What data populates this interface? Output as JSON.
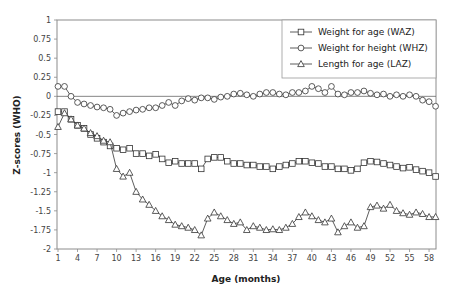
{
  "chart_data": {
    "type": "line",
    "title": "",
    "xlabel": "Age (months)",
    "ylabel": "Z-scores (WHO)",
    "xlim": [
      1,
      59
    ],
    "ylim": [
      -2,
      1
    ],
    "grid": false,
    "legend_position": "top-right",
    "x_ticks": [
      "1",
      "4",
      "7",
      "10",
      "13",
      "16",
      "19",
      "22",
      "25",
      "28",
      "31",
      "34",
      "37",
      "40",
      "43",
      "46",
      "49",
      "52",
      "55",
      "58"
    ],
    "y_ticks": [
      "1",
      "0.75",
      "0.5",
      "0.25",
      "0",
      "-0.25",
      "-0.5",
      "-0.75",
      "-1",
      "-1.25",
      "-1.5",
      "-1.75",
      "-2"
    ],
    "x": [
      1,
      2,
      3,
      4,
      5,
      6,
      7,
      8,
      9,
      10,
      11,
      12,
      13,
      14,
      15,
      16,
      17,
      18,
      19,
      20,
      21,
      22,
      23,
      24,
      25,
      26,
      27,
      28,
      29,
      30,
      31,
      32,
      33,
      34,
      35,
      36,
      37,
      38,
      39,
      40,
      41,
      42,
      43,
      44,
      45,
      46,
      47,
      48,
      49,
      50,
      51,
      52,
      53,
      54,
      55,
      56,
      57,
      58,
      59
    ],
    "series": [
      {
        "name": "Weight for age (WAZ)",
        "marker": "square",
        "values": [
          -0.2,
          -0.2,
          -0.3,
          -0.38,
          -0.42,
          -0.5,
          -0.55,
          -0.6,
          -0.65,
          -0.68,
          -0.7,
          -0.68,
          -0.75,
          -0.75,
          -0.78,
          -0.76,
          -0.82,
          -0.87,
          -0.85,
          -0.88,
          -0.88,
          -0.88,
          -0.95,
          -0.82,
          -0.8,
          -0.8,
          -0.85,
          -0.88,
          -0.88,
          -0.9,
          -0.9,
          -0.92,
          -0.92,
          -0.95,
          -0.92,
          -0.9,
          -0.88,
          -0.85,
          -0.85,
          -0.87,
          -0.88,
          -0.92,
          -0.92,
          -0.95,
          -0.95,
          -0.97,
          -0.95,
          -0.87,
          -0.85,
          -0.86,
          -0.88,
          -0.9,
          -0.92,
          -0.94,
          -0.93,
          -0.96,
          -0.98,
          -1.0,
          -1.05
        ]
      },
      {
        "name": "Weight for height (WHZ)",
        "marker": "circle",
        "values": [
          0.13,
          0.13,
          0.0,
          -0.08,
          -0.1,
          -0.12,
          -0.14,
          -0.15,
          -0.17,
          -0.25,
          -0.22,
          -0.2,
          -0.18,
          -0.17,
          -0.15,
          -0.15,
          -0.12,
          -0.08,
          -0.12,
          -0.06,
          -0.03,
          -0.05,
          -0.02,
          -0.02,
          -0.04,
          -0.01,
          0.0,
          0.03,
          0.04,
          0.02,
          0.0,
          0.03,
          0.05,
          0.05,
          0.03,
          0.02,
          0.05,
          0.05,
          0.07,
          0.13,
          0.1,
          0.05,
          0.13,
          0.03,
          0.02,
          0.05,
          0.05,
          0.07,
          0.04,
          0.02,
          0.03,
          0.0,
          0.02,
          0.0,
          0.02,
          0.0,
          -0.05,
          -0.07,
          -0.13
        ]
      },
      {
        "name": "Length for age (LAZ)",
        "marker": "triangle",
        "values": [
          -0.4,
          -0.22,
          -0.3,
          -0.38,
          -0.42,
          -0.48,
          -0.52,
          -0.58,
          -0.6,
          -0.95,
          -1.05,
          -1.0,
          -1.25,
          -1.35,
          -1.42,
          -1.5,
          -1.57,
          -1.62,
          -1.68,
          -1.7,
          -1.72,
          -1.75,
          -1.82,
          -1.6,
          -1.52,
          -1.57,
          -1.62,
          -1.67,
          -1.65,
          -1.75,
          -1.7,
          -1.72,
          -1.75,
          -1.74,
          -1.75,
          -1.72,
          -1.67,
          -1.58,
          -1.52,
          -1.57,
          -1.62,
          -1.65,
          -1.6,
          -1.78,
          -1.7,
          -1.65,
          -1.72,
          -1.7,
          -1.45,
          -1.43,
          -1.47,
          -1.42,
          -1.5,
          -1.53,
          -1.55,
          -1.52,
          -1.54,
          -1.58,
          -1.58
        ]
      }
    ]
  }
}
